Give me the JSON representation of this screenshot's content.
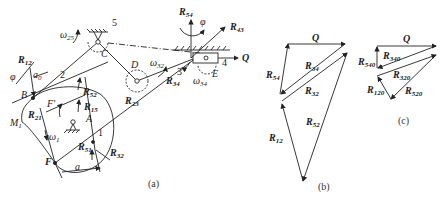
{
  "figure": {
    "panels": [
      {
        "id": "a",
        "caption": "(a)",
        "title": "Mechanism with cam and linkages"
      },
      {
        "id": "b",
        "caption": "(b)",
        "title": "Force polygon"
      },
      {
        "id": "c",
        "caption": "(c)",
        "title": "Force polygon (no friction)"
      }
    ],
    "panel_a": {
      "points": {
        "A": "A",
        "B": "B",
        "C": "C",
        "D": "D",
        "E": "E",
        "F": "F",
        "Fp": "F'",
        "M1": "M",
        "M1_sub": "1"
      },
      "links": {
        "l1": "1",
        "l2": "2",
        "l3": "3",
        "l4": "4",
        "l5": "5"
      },
      "forces": {
        "R12": {
          "main": "R",
          "sub": "12"
        },
        "R21": {
          "main": "R",
          "sub": "21"
        },
        "R52": {
          "main": "R",
          "sub": "52"
        },
        "R15": {
          "main": "R",
          "sub": "15"
        },
        "R51": {
          "main": "R",
          "sub": "51"
        },
        "R32": {
          "main": "R",
          "sub": "32"
        },
        "R23": {
          "main": "R",
          "sub": "23"
        },
        "R34": {
          "main": "R",
          "sub": "34"
        },
        "R43": {
          "main": "R",
          "sub": "43"
        },
        "R54": {
          "main": "R",
          "sub": "54"
        },
        "Q": "Q"
      },
      "angular": {
        "w25": {
          "main": "ω",
          "sub": "25"
        },
        "w32": {
          "main": "ω",
          "sub": "32"
        },
        "w34": {
          "main": "ω",
          "sub": "34"
        },
        "w1": {
          "main": "ω",
          "sub": "1"
        }
      },
      "dims": {
        "phi": "φ",
        "a0": "a",
        "a0_sub": "0",
        "a": "a"
      }
    },
    "panel_b": {
      "Q": "Q",
      "R34": {
        "main": "R",
        "sub": "34"
      },
      "R54": {
        "main": "R",
        "sub": "54"
      },
      "R32": {
        "main": "R",
        "sub": "32"
      },
      "R52": {
        "main": "R",
        "sub": "52"
      },
      "R12": {
        "main": "R",
        "sub": "12"
      }
    },
    "panel_c": {
      "Q": "Q",
      "R340": {
        "main": "R",
        "sub": "340"
      },
      "R540": {
        "main": "R",
        "sub": "540"
      },
      "R320": {
        "main": "R",
        "sub": "320"
      },
      "R120": {
        "main": "R",
        "sub": "120"
      },
      "R520": {
        "main": "R",
        "sub": "520"
      }
    }
  }
}
